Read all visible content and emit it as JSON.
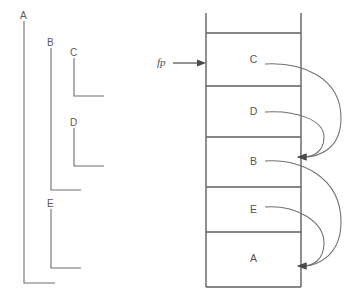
{
  "diagram": {
    "background_color": "#ffffff",
    "line_color": "#6d6d6d",
    "text_color": "#555555"
  },
  "static_brackets": {
    "description": "Nesting-level brackets on the left",
    "items": [
      {
        "label": "A",
        "depth": 0
      },
      {
        "label": "B",
        "depth": 1
      },
      {
        "label": "C",
        "depth": 2
      },
      {
        "label": "D",
        "depth": 2
      },
      {
        "label": "E",
        "depth": 1
      }
    ]
  },
  "pointer": {
    "label": "fp",
    "points_to": "C"
  },
  "stack": {
    "label": "runtime stack",
    "frames": [
      {
        "label": "C"
      },
      {
        "label": "D"
      },
      {
        "label": "B"
      },
      {
        "label": "E"
      },
      {
        "label": "A"
      }
    ]
  },
  "links": {
    "description": "Dynamic/static link arrows from frame to frame",
    "arrows": [
      {
        "from": "C",
        "to": "B"
      },
      {
        "from": "D",
        "to": "B"
      },
      {
        "from": "B",
        "to": "A"
      },
      {
        "from": "E",
        "to": "A"
      }
    ]
  }
}
